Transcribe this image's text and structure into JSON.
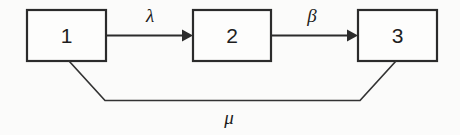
{
  "diagram": {
    "type": "state-transition-diagram",
    "background_color": "#fbfbfa",
    "stroke_color": "#2b2b2b",
    "nodes": [
      {
        "id": "node-1",
        "label": "1",
        "x": 27,
        "y": 10,
        "width": 79,
        "height": 51
      },
      {
        "id": "node-2",
        "label": "2",
        "x": 193,
        "y": 10,
        "width": 78,
        "height": 51
      },
      {
        "id": "node-3",
        "label": "3",
        "x": 358,
        "y": 10,
        "width": 79,
        "height": 51
      }
    ],
    "edges": [
      {
        "id": "edge-lambda",
        "label": "λ",
        "label_name": "lambda",
        "from": "node-1",
        "to": "node-2",
        "direction": "forward",
        "label_x": 150,
        "label_y": 22
      },
      {
        "id": "edge-beta",
        "label": "β",
        "label_name": "beta",
        "from": "node-2",
        "to": "node-3",
        "direction": "forward",
        "label_x": 312,
        "label_y": 22
      },
      {
        "id": "edge-mu",
        "label": "μ",
        "label_name": "mu",
        "from": "node-3",
        "to": "node-1",
        "direction": "feedback",
        "label_x": 229,
        "label_y": 124
      }
    ]
  }
}
